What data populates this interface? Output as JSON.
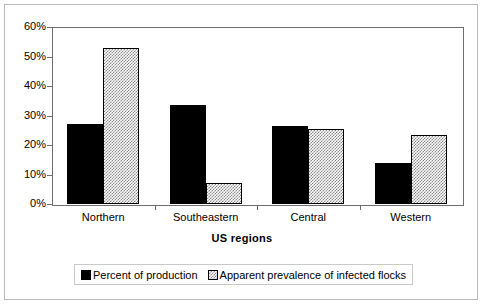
{
  "chart_data": {
    "type": "bar",
    "title": "",
    "subtitle": "",
    "xlabel": "US regions",
    "ylabel": "",
    "categories": [
      "Northern",
      "Southeastern",
      "Central",
      "Western"
    ],
    "series": [
      {
        "name": "Percent of production",
        "values": [
          27,
          33.5,
          26.5,
          14
        ],
        "color": "#000000",
        "fill": "solid-black"
      },
      {
        "name": "Apparent prevalence of infected flocks",
        "values": [
          53,
          7,
          25.5,
          23.5
        ],
        "color": "#8a8a8a",
        "fill": "gray-checker-hatch"
      }
    ],
    "ylim": [
      0,
      60
    ],
    "ytick_values": [
      0,
      10,
      20,
      30,
      40,
      50,
      60
    ],
    "ytick_labels": [
      "0%",
      "10%",
      "20%",
      "30%",
      "40%",
      "50%",
      "60%"
    ],
    "grid": false,
    "legend_position": "bottom",
    "axis_color": "#6e6e6e",
    "border_color": "#b9b9b9"
  }
}
